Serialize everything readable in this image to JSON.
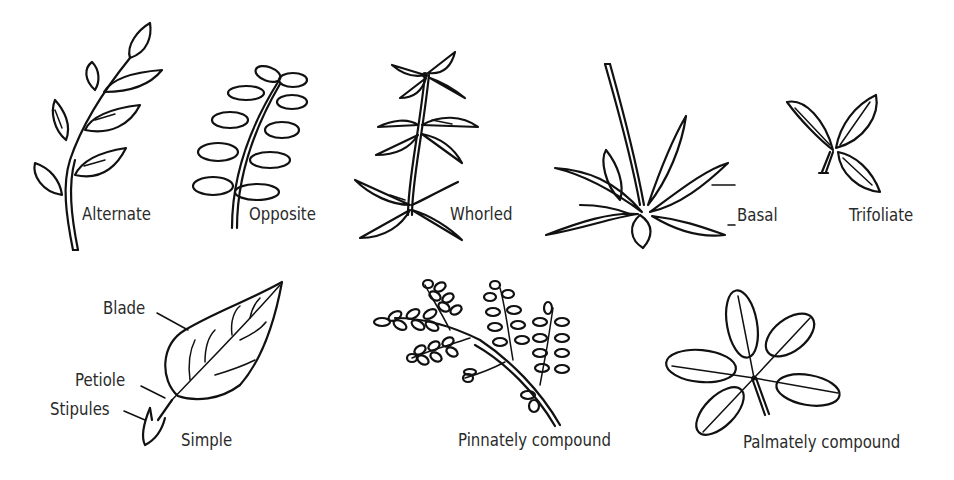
{
  "diagram": {
    "ink_color": "#111111",
    "label_color": "#2a2a2a",
    "background": "#ffffff",
    "arrangements": [
      {
        "id": "alternate",
        "label": "Alternate"
      },
      {
        "id": "opposite",
        "label": "Opposite"
      },
      {
        "id": "whorled",
        "label": "Whorled"
      },
      {
        "id": "basal",
        "label": "Basal"
      },
      {
        "id": "trifoliate",
        "label": "Trifoliate"
      }
    ],
    "leaf_types": [
      {
        "id": "simple",
        "label": "Simple",
        "parts": [
          {
            "id": "blade",
            "label": "Blade"
          },
          {
            "id": "petiole",
            "label": "Petiole"
          },
          {
            "id": "stipules",
            "label": "Stipules"
          }
        ]
      },
      {
        "id": "pinnately",
        "label": "Pinnately compound"
      },
      {
        "id": "palmately",
        "label": "Palmately compound"
      }
    ]
  }
}
